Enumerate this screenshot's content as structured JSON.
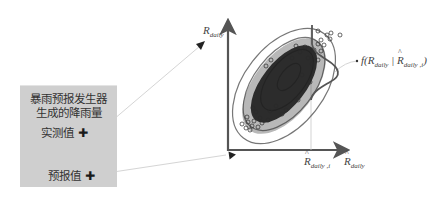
{
  "generator_box": {
    "title_line1": "暴雨预报发生器",
    "title_line2": "生成的降雨量",
    "observed_label": "实测值",
    "forecast_label": "预报值",
    "marker": "✚"
  },
  "plot": {
    "y_axis_label": {
      "base": "R",
      "sub": "daily"
    },
    "x_axis_label": {
      "base": "R",
      "sub": "daily",
      "hat": true
    },
    "x_tick_label": {
      "base": "R",
      "sub": "daily ,i",
      "hat": true
    },
    "density_label": {
      "prefix": "f(R",
      "sub1": "daily",
      "mid": " | ",
      "base2": "R",
      "sub2": "daily ,i",
      "suffix": ")"
    }
  },
  "colors": {
    "box_fill": "#cfcfcf",
    "axis": "#555555",
    "scatter": "#333333",
    "contour": "#777777",
    "connector": "#d0d0d0"
  }
}
